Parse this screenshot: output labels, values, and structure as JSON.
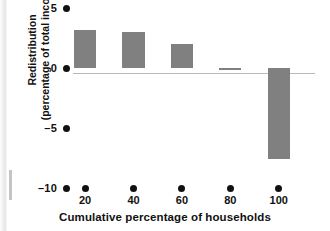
{
  "chart_data": {
    "type": "bar",
    "title": "",
    "subtitle": "",
    "xlabel": "Cumulative percentage of households",
    "ylabel": "Redistribution (percentage of total income)",
    "ylabel_line1": "Redistribution",
    "ylabel_line2": "(percentage of total income)",
    "categories": [
      "20",
      "40",
      "60",
      "80",
      "100"
    ],
    "values": [
      3.2,
      3.0,
      2.0,
      -0.15,
      -7.6
    ],
    "x": [
      20,
      40,
      60,
      80,
      100
    ],
    "ylim": [
      -10,
      5
    ],
    "yticks": [
      5,
      0,
      -5,
      -10
    ],
    "ytick_labels": [
      "5",
      "0",
      "–5",
      "–10"
    ],
    "xlim": [
      10,
      110
    ],
    "xticks": [
      20,
      40,
      60,
      80,
      100
    ],
    "xtick_labels": [
      "20",
      "40",
      "60",
      "80",
      "100"
    ],
    "grid": false,
    "legend": false,
    "bar_color": "#808080",
    "axis_marker_color": "#111111",
    "zero_line_color": "#b9b9b9",
    "tick_marker_style": "dot",
    "series": [
      {
        "name": "Redistribution",
        "values": [
          3.2,
          3.0,
          2.0,
          -0.15,
          -7.6
        ]
      }
    ]
  }
}
